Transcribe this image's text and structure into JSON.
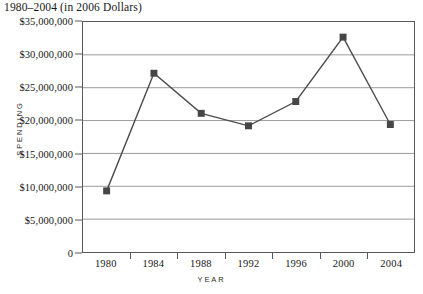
{
  "chart_data": {
    "type": "line",
    "title": "1980–2004 (in 2006 Dollars)",
    "xlabel": "YEAR",
    "ylabel": "SPENDING",
    "categories": [
      "1980",
      "1984",
      "1988",
      "1992",
      "1996",
      "2000",
      "2004"
    ],
    "values": [
      9300000,
      27200000,
      21100000,
      19200000,
      22900000,
      32700000,
      19400000
    ],
    "series": [
      {
        "name": "Spending",
        "values": [
          9300000,
          27200000,
          21100000,
          19200000,
          22900000,
          32700000,
          19400000
        ]
      }
    ],
    "ylim": [
      0,
      35000000
    ],
    "ytick_values": [
      0,
      5000000,
      10000000,
      15000000,
      20000000,
      25000000,
      30000000,
      35000000
    ],
    "ytick_labels": [
      "0",
      "$5,000,000",
      "$10,000,000",
      "$15,000,000",
      "$20,000,000",
      "$25,000,000",
      "$30,000,000",
      "$35,000,000"
    ],
    "xtick_labels": [
      "1980",
      "1984",
      "1988",
      "1992",
      "1996",
      "2000",
      "2004"
    ],
    "grid": "horizontal",
    "legend": "none",
    "marker": "square",
    "line_color": "#4d4d4d",
    "marker_color": "#464646",
    "grid_color": "#9a9a9a",
    "axis_color": "#585858",
    "background_color": "#ffffff"
  }
}
